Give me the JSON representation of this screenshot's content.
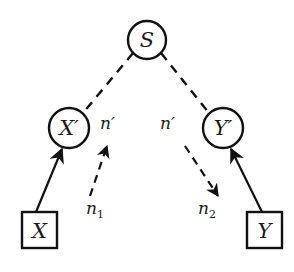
{
  "diagram": {
    "type": "causal-graph",
    "colors": {
      "stroke": "#111111",
      "background": "#ffffff"
    },
    "nodes": [
      {
        "id": "S",
        "label": "S",
        "shape": "circle",
        "cx": 147,
        "cy": 40,
        "r": 19
      },
      {
        "id": "Xp",
        "label": "X′",
        "shape": "circle",
        "cx": 69,
        "cy": 128,
        "r": 20
      },
      {
        "id": "Yp",
        "label": "Y′",
        "shape": "circle",
        "cx": 223,
        "cy": 128,
        "r": 20
      },
      {
        "id": "X",
        "label": "X",
        "shape": "square",
        "x": 22,
        "y": 212,
        "w": 35,
        "h": 36
      },
      {
        "id": "Y",
        "label": "Y",
        "shape": "square",
        "x": 247,
        "y": 212,
        "w": 35,
        "h": 36
      }
    ],
    "edges": [
      {
        "from": "S",
        "to": "Xp",
        "style": "dashed",
        "arrow": false
      },
      {
        "from": "S",
        "to": "Yp",
        "style": "dashed",
        "arrow": false
      },
      {
        "from": "X",
        "to": "Xp",
        "style": "solid",
        "arrow": true
      },
      {
        "from": "Y",
        "to": "Yp",
        "style": "solid",
        "arrow": true
      }
    ],
    "annotations": {
      "left_top": "n′",
      "left_bottom_base": "n",
      "left_bottom_sub": "1",
      "right_top": "n′",
      "right_bottom_base": "n",
      "right_bottom_sub": "2"
    },
    "flows": [
      {
        "from_label": "n1",
        "to_label": "n′",
        "style": "dashed",
        "direction": "up-right"
      },
      {
        "from_label": "n′",
        "to_label": "n2",
        "style": "dashed",
        "direction": "down-right"
      }
    ]
  }
}
